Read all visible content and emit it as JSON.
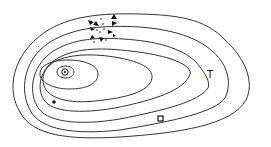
{
  "diagram": {
    "type": "contour-map",
    "background": "#ffffff",
    "line_color": "#333333",
    "contour_count": 7,
    "symbols": {
      "ring_dot": {
        "name": "circle-with-dot",
        "x": 65,
        "y": 72
      },
      "filled_dot": {
        "name": "filled-dot",
        "x": 54,
        "y": 102
      },
      "text_marker": {
        "label": "T",
        "x": 211,
        "y": 75
      },
      "square": {
        "name": "open-square",
        "x": 161,
        "y": 119
      },
      "arrow_cluster": {
        "name": "arrowhead-cluster",
        "x": 105,
        "y": 28
      }
    }
  }
}
